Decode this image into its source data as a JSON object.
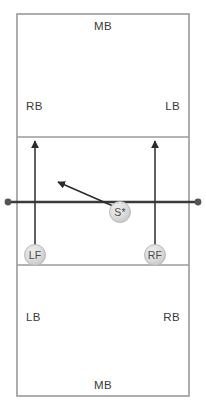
{
  "diagram": {
    "court": {
      "outline": {
        "x": 17,
        "y": 14,
        "width": 172,
        "height": 382
      },
      "attack_lines": [
        {
          "name": "far-attack-line",
          "y": 137
        },
        {
          "name": "near-attack-line",
          "y": 265
        }
      ],
      "net": {
        "y": 202,
        "x1": 6,
        "x2": 200,
        "post_left_x": 8,
        "post_right_x": 198,
        "post_radius": 3.4
      },
      "line_color": "#9a9a9a",
      "net_color": "#3a3a3a",
      "background_color": "#ffffff"
    },
    "zone_labels": [
      {
        "name": "far-middle-back",
        "text": "MB",
        "x": 103,
        "y": 30,
        "anchor": "center"
      },
      {
        "name": "far-right-back",
        "text": "RB",
        "x": 26,
        "y": 110,
        "anchor": "start"
      },
      {
        "name": "far-left-back",
        "text": "LB",
        "x": 180,
        "y": 110,
        "anchor": "end"
      },
      {
        "name": "near-left-back",
        "text": "LB",
        "x": 26,
        "y": 321,
        "anchor": "start"
      },
      {
        "name": "near-right-back",
        "text": "RB",
        "x": 180,
        "y": 321,
        "anchor": "end"
      },
      {
        "name": "near-middle-back",
        "text": "MB",
        "x": 103,
        "y": 389,
        "anchor": "center"
      }
    ],
    "players": [
      {
        "name": "setter",
        "label": "S*",
        "x": 120,
        "y": 212,
        "radius": 10.5,
        "fill": "#d4d4d4",
        "text_color": "#4a4a4a"
      },
      {
        "name": "left-front",
        "label": "LF",
        "x": 35,
        "y": 255,
        "radius": 10.5,
        "fill": "#d4d4d4",
        "text_color": "#4a4a4a"
      },
      {
        "name": "right-front",
        "label": "RF",
        "x": 155,
        "y": 255,
        "radius": 10.5,
        "fill": "#d4d4d4",
        "text_color": "#4a4a4a"
      }
    ],
    "arrows": [
      {
        "name": "left-front-movement-arrow",
        "x1": 35,
        "y1": 246,
        "x2": 35,
        "y2": 141,
        "double_headed": true,
        "color": "#2b2b2b"
      },
      {
        "name": "right-front-movement-arrow",
        "x1": 155,
        "y1": 246,
        "x2": 155,
        "y2": 141,
        "double_headed": true,
        "color": "#2b2b2b"
      },
      {
        "name": "setter-movement-arrow",
        "x1": 113,
        "y1": 206,
        "x2": 58,
        "y2": 182,
        "double_headed": true,
        "color": "#2b2b2b"
      }
    ]
  }
}
